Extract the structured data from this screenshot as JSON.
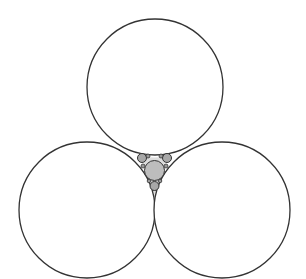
{
  "diagram": {
    "type": "apollonian-gasket",
    "background": "#ffffff",
    "stroke_color": "#333333",
    "outer_circles": [
      {
        "name": "top-circle",
        "cx": 155,
        "cy": 87,
        "r": 68
      },
      {
        "name": "left-circle",
        "cx": 87,
        "cy": 210,
        "r": 68
      },
      {
        "name": "right-circle",
        "cx": 222,
        "cy": 210,
        "r": 68
      }
    ],
    "inner_circles": [
      {
        "name": "center-circle",
        "cx": 154.5,
        "cy": 170.5,
        "r": 10,
        "fill": "#bdbdbd"
      },
      {
        "name": "small-upper-left",
        "cx": 142,
        "cy": 158,
        "r": 4.5,
        "fill": "#a8a8a8"
      },
      {
        "name": "small-upper-right",
        "cx": 167,
        "cy": 158,
        "r": 4.5,
        "fill": "#a8a8a8"
      },
      {
        "name": "small-bottom",
        "cx": 154.5,
        "cy": 186,
        "r": 4.5,
        "fill": "#a8a8a8"
      },
      {
        "name": "tiny-1",
        "cx": 148,
        "cy": 156,
        "r": 2,
        "fill": "#999999"
      },
      {
        "name": "tiny-2",
        "cx": 161,
        "cy": 156,
        "r": 2,
        "fill": "#999999"
      },
      {
        "name": "tiny-3",
        "cx": 143,
        "cy": 166,
        "r": 2,
        "fill": "#999999"
      },
      {
        "name": "tiny-4",
        "cx": 166,
        "cy": 166,
        "r": 2,
        "fill": "#999999"
      },
      {
        "name": "tiny-5",
        "cx": 149,
        "cy": 181,
        "r": 1.8,
        "fill": "#999999"
      },
      {
        "name": "tiny-6",
        "cx": 160,
        "cy": 181,
        "r": 1.8,
        "fill": "#999999"
      }
    ]
  }
}
